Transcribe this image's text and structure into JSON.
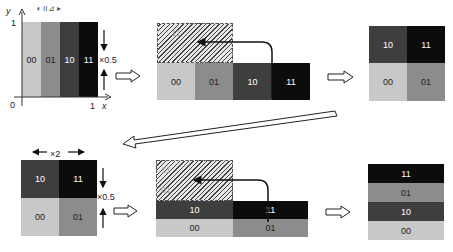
{
  "colors": {
    "c00": "#c8c8c8",
    "c01": "#8c8c8c",
    "c10": "#3e3e3e",
    "c11": "#0c0c0c",
    "text_light": "#ffffff",
    "text_dark": "#222222"
  },
  "panel1": {
    "y_axis_label": "y",
    "x_axis_label": "x",
    "tick_y1": "1",
    "tick_origin": "0",
    "tick_x1": "1",
    "top_glyphs": "◖   II⊿   ▸",
    "bars": [
      "00",
      "01",
      "10",
      "11"
    ],
    "scale_label": "×0.5"
  },
  "panel2": {
    "bars": [
      "00",
      "01",
      "10",
      "11"
    ],
    "hatched_label": "11"
  },
  "panel3": {
    "top_row": [
      "10",
      "11"
    ],
    "bottom_row": [
      "00",
      "01"
    ]
  },
  "panel4": {
    "top_row": [
      "10",
      "11"
    ],
    "bottom_row": [
      "00",
      "01"
    ],
    "width_scale_label": "×2",
    "height_scale_label": "×0.5"
  },
  "panel5": {
    "top_row": [
      "10",
      "11"
    ],
    "bottom_row": [
      "00",
      "01"
    ],
    "hatched_labels": [
      "11",
      "01"
    ]
  },
  "panel6": {
    "rows": [
      "11",
      "01",
      "10",
      "00"
    ]
  }
}
